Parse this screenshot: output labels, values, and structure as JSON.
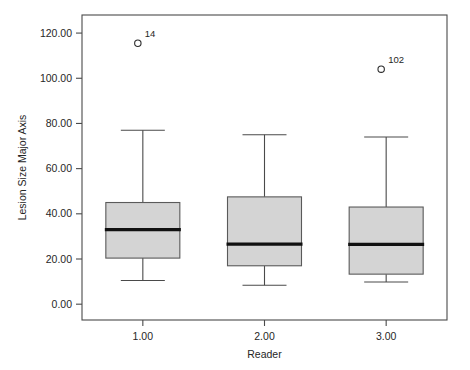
{
  "chart_data": {
    "type": "box",
    "title": "",
    "xlabel": "Reader",
    "ylabel": "Lesion Size Major Axis",
    "xlim": [
      0.5,
      3.5
    ],
    "ylim": [
      -7.0,
      128.0
    ],
    "grid": false,
    "legend": false,
    "y_ticks": [
      {
        "value": 0,
        "label": "0.00"
      },
      {
        "value": 20,
        "label": "20.00"
      },
      {
        "value": 40,
        "label": "40.00"
      },
      {
        "value": 60,
        "label": "60.00"
      },
      {
        "value": 80,
        "label": "80.00"
      },
      {
        "value": 100,
        "label": "100.00"
      },
      {
        "value": 120,
        "label": "120.00"
      }
    ],
    "x_ticks": [
      {
        "value": 1,
        "label": "1.00"
      },
      {
        "value": 2,
        "label": "2.00"
      },
      {
        "value": 3,
        "label": "3.00"
      }
    ],
    "categories": [
      "1.00",
      "2.00",
      "3.00"
    ],
    "boxes": [
      {
        "category": "1.00",
        "x": 1,
        "whisker_low": 10.5,
        "q1": 20.4,
        "median": 33.0,
        "q3": 45.0,
        "whisker_high": 77.0,
        "outliers": [
          {
            "value": 115.5,
            "label": "14"
          }
        ]
      },
      {
        "category": "2.00",
        "x": 2,
        "whisker_low": 8.4,
        "q1": 17.0,
        "median": 26.6,
        "q3": 47.5,
        "whisker_high": 75.0,
        "outliers": []
      },
      {
        "category": "3.00",
        "x": 3,
        "whisker_low": 9.8,
        "q1": 13.3,
        "median": 26.5,
        "q3": 43.0,
        "whisker_high": 74.0,
        "outliers": [
          {
            "value": 104.0,
            "label": "102"
          }
        ]
      }
    ],
    "colors": {
      "box_fill": "#d4d4d4",
      "box_stroke": "#5a5a5a",
      "median": "#111111",
      "whisker": "#4a4a4a",
      "axis": "#4a4a4a",
      "text": "#262626",
      "background": "#ffffff"
    }
  }
}
